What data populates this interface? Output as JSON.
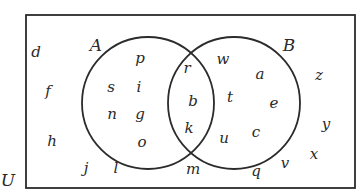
{
  "diagram": {
    "type": "venn",
    "universe": {
      "label": "U",
      "only_elements": [
        "d",
        "f",
        "h",
        "j",
        "l",
        "m",
        "q",
        "v",
        "x",
        "y",
        "z"
      ]
    },
    "sets": [
      {
        "label": "A",
        "only_elements": [
          "p",
          "s",
          "i",
          "n",
          "g",
          "o"
        ]
      },
      {
        "label": "B",
        "only_elements": [
          "w",
          "a",
          "t",
          "e",
          "u",
          "c"
        ]
      }
    ],
    "intersection_AB": [
      "r",
      "b",
      "k"
    ],
    "placements": [
      {
        "t": "d",
        "x": 36,
        "y": 57
      },
      {
        "t": "f",
        "x": 48,
        "y": 96
      },
      {
        "t": "h",
        "x": 52,
        "y": 146
      },
      {
        "t": "j",
        "x": 86,
        "y": 173
      },
      {
        "t": "l",
        "x": 116,
        "y": 173
      },
      {
        "t": "p",
        "x": 140,
        "y": 63
      },
      {
        "t": "s",
        "x": 111,
        "y": 92
      },
      {
        "t": "i",
        "x": 139,
        "y": 92
      },
      {
        "t": "n",
        "x": 112,
        "y": 119
      },
      {
        "t": "g",
        "x": 140,
        "y": 119
      },
      {
        "t": "o",
        "x": 142,
        "y": 147
      },
      {
        "t": "r",
        "x": 187,
        "y": 73
      },
      {
        "t": "b",
        "x": 193,
        "y": 106
      },
      {
        "t": "k",
        "x": 189,
        "y": 133
      },
      {
        "t": "m",
        "x": 193,
        "y": 174
      },
      {
        "t": "w",
        "x": 223,
        "y": 64
      },
      {
        "t": "a",
        "x": 260,
        "y": 79
      },
      {
        "t": "t",
        "x": 230,
        "y": 102
      },
      {
        "t": "e",
        "x": 274,
        "y": 108
      },
      {
        "t": "u",
        "x": 224,
        "y": 143
      },
      {
        "t": "c",
        "x": 256,
        "y": 137
      },
      {
        "t": "q",
        "x": 256,
        "y": 176
      },
      {
        "t": "v",
        "x": 285,
        "y": 168
      },
      {
        "t": "x",
        "x": 314,
        "y": 159
      },
      {
        "t": "y",
        "x": 326,
        "y": 129
      },
      {
        "t": "z",
        "x": 319,
        "y": 80
      }
    ],
    "set_labels": [
      {
        "t": "A",
        "x": 96,
        "y": 51
      },
      {
        "t": "B",
        "x": 289,
        "y": 51
      },
      {
        "t": "U",
        "x": 8,
        "y": 186
      }
    ],
    "geometry": {
      "box": {
        "x": 26,
        "y": 15,
        "w": 329,
        "h": 173
      },
      "circle_a": {
        "cx": 148,
        "cy": 103,
        "r": 66
      },
      "circle_b": {
        "cx": 234,
        "cy": 103,
        "r": 66
      }
    },
    "colors": {
      "stroke": "#2b2b2b",
      "text": "#2a2a2a",
      "background": "#ffffff"
    }
  }
}
